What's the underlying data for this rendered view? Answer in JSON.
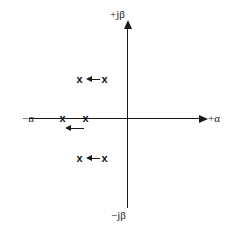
{
  "figure": {
    "background_color": "#ffffff",
    "line_color": "#1a1a1a",
    "marker_color": "#111111",
    "width": 232,
    "height": 232
  },
  "axes": {
    "imaginary": {
      "positive_label": "+jβ",
      "negative_label": "−jβ",
      "orientation": "vertical",
      "arrow_direction": "up"
    },
    "real": {
      "positive_label": "+α",
      "negative_label": "−α",
      "orientation": "horizontal",
      "arrow_direction": "right"
    },
    "origin_label": ""
  },
  "chart_data": {
    "type": "scatter",
    "xlabel": "α",
    "ylabel": "jβ",
    "grid": false,
    "legend": null,
    "origin_px": {
      "x": 127,
      "y": 118
    },
    "marker_symbol": "x",
    "series": [
      {
        "name": "upper-conjugate-pole-pair",
        "marker": "x",
        "points": [
          {
            "label": "pole-upper-left",
            "px": {
              "x": 79,
              "y": 79
            }
          },
          {
            "label": "pole-upper-right",
            "px": {
              "x": 104,
              "y": 79
            }
          }
        ],
        "motion_arrow": {
          "direction": "left",
          "px": {
            "x": 86,
            "y": 76
          },
          "length": 14
        }
      },
      {
        "name": "real-axis-pole-pair",
        "marker": "x",
        "points": [
          {
            "label": "pole-real-left",
            "px": {
              "x": 62,
              "y": 118
            }
          },
          {
            "label": "pole-real-right",
            "px": {
              "x": 85,
              "y": 118
            }
          }
        ],
        "motion_arrow": {
          "direction": "left",
          "px": {
            "x": 65,
            "y": 125
          },
          "length": 19
        }
      },
      {
        "name": "lower-conjugate-pole-pair",
        "marker": "x",
        "points": [
          {
            "label": "pole-lower-left",
            "px": {
              "x": 79,
              "y": 158
            }
          },
          {
            "label": "pole-lower-right",
            "px": {
              "x": 104,
              "y": 158
            }
          }
        ],
        "motion_arrow": {
          "direction": "left",
          "px": {
            "x": 86,
            "y": 155
          },
          "length": 14
        }
      }
    ],
    "annotations": [
      {
        "text": "+jβ",
        "px": {
          "x": 110,
          "y": 9
        }
      },
      {
        "text": "−jβ",
        "px": {
          "x": 111,
          "y": 210
        }
      },
      {
        "text": "−α",
        "px": {
          "x": 22,
          "y": 113
        }
      },
      {
        "text": "+α",
        "px": {
          "x": 208,
          "y": 113
        }
      }
    ]
  },
  "markers": {
    "glyph": "x",
    "upper_left": "x",
    "upper_right": "x",
    "real_left": "x",
    "real_right": "x",
    "lower_left": "x",
    "lower_right": "x"
  }
}
